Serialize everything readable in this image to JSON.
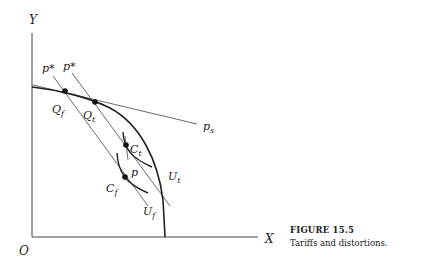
{
  "figure": {
    "caption_title": "FIGURE 15.5",
    "caption_text": "Tariffs and distortions."
  },
  "axes": {
    "y_label": "Y",
    "x_label": "X",
    "origin_label": "O"
  },
  "curves": {
    "ppf": "production possibility frontier",
    "price_line_label": "p",
    "price_line_sub": "s",
    "world_price_label_1": "p*",
    "world_price_label_2": "p*",
    "indifference_t_label": "U",
    "indifference_t_sub": "t",
    "indifference_f_label": "U",
    "indifference_f_sub": "f",
    "p_label": "p"
  },
  "points": {
    "Qf": {
      "label": "Q",
      "sub": "f"
    },
    "Qt": {
      "label": "Q",
      "sub": "t"
    },
    "Ct": {
      "label": "C",
      "sub": "t"
    },
    "Cf": {
      "label": "C",
      "sub": "f"
    }
  }
}
